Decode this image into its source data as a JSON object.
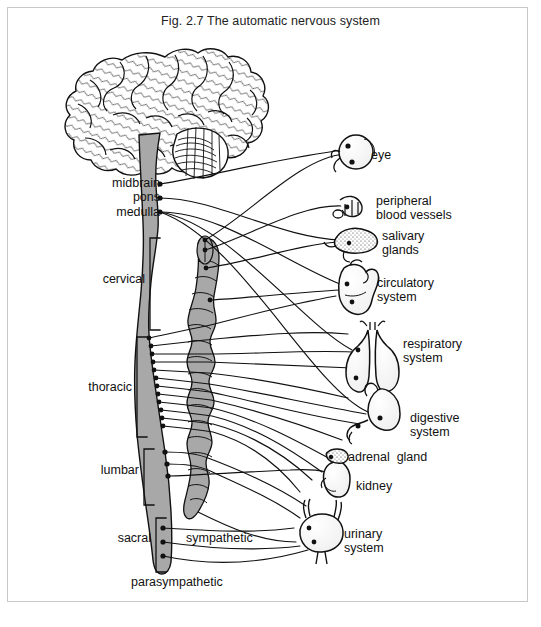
{
  "figure": {
    "title": "Fig. 2.7 The automatic nervous system",
    "ink_color": "#111111",
    "fill_gray": "#a8a8a8",
    "border_color": "#c9c9c9",
    "background": "#ffffff"
  },
  "brainstem_labels": [
    {
      "name": "midbrain",
      "text": "midbrain",
      "x": 100,
      "y": 183
    },
    {
      "name": "pons",
      "text": "pons",
      "x": 130,
      "y": 197
    },
    {
      "name": "medulla",
      "text": "medulla",
      "x": 110,
      "y": 212
    }
  ],
  "spinal_regions": [
    {
      "name": "cervical",
      "text": "cervical",
      "x": 92,
      "y": 272,
      "bracket_top": 238,
      "bracket_bottom": 330
    },
    {
      "name": "thoracic",
      "text": "thoracic",
      "x": 92,
      "y": 385,
      "bracket_top": 337,
      "bracket_bottom": 437
    },
    {
      "name": "lumbar",
      "text": "lumbar",
      "x": 100,
      "y": 466,
      "bracket_top": 449,
      "bracket_bottom": 505
    },
    {
      "name": "sacral",
      "text": "sacral",
      "x": 110,
      "y": 538,
      "bracket_top": 518,
      "bracket_bottom": 572
    }
  ],
  "chain_labels": [
    {
      "name": "sympathetic",
      "text": "sympathetic",
      "x": 186,
      "y": 538
    },
    {
      "name": "parasympathetic",
      "text": "parasympathetic",
      "x": 131,
      "y": 582
    }
  ],
  "organ_labels": [
    {
      "name": "eye",
      "lines": [
        "eye"
      ],
      "x": 371,
      "y": 155
    },
    {
      "name": "peripheral-blood-vessels",
      "lines": [
        "peripheral",
        "blood vessels"
      ],
      "x": 376,
      "y": 201
    },
    {
      "name": "salivary-glands",
      "lines": [
        "salivary",
        "glands"
      ],
      "x": 382,
      "y": 235
    },
    {
      "name": "circulatory-system",
      "lines": [
        "circulatory",
        "system"
      ],
      "x": 377,
      "y": 283
    },
    {
      "name": "respiratory-system",
      "lines": [
        "respiratory",
        "system"
      ],
      "x": 403,
      "y": 344
    },
    {
      "name": "digestive-system",
      "lines": [
        "digestive",
        "system"
      ],
      "x": 410,
      "y": 418
    },
    {
      "name": "adrenal-gland",
      "lines": [
        "adrenal  gland"
      ],
      "x": 348,
      "y": 457
    },
    {
      "name": "kidney",
      "lines": [
        "kidney"
      ],
      "x": 356,
      "y": 486
    },
    {
      "name": "urinary-system",
      "lines": [
        "urinary",
        "system"
      ],
      "x": 344,
      "y": 534
    }
  ],
  "organs": [
    {
      "name": "eye",
      "cx": 356,
      "cy": 152
    },
    {
      "name": "peripheral-blood-vessels",
      "cx": 356,
      "cy": 208
    },
    {
      "name": "salivary-glands",
      "cx": 356,
      "cy": 240
    },
    {
      "name": "heart",
      "cx": 356,
      "cy": 288
    },
    {
      "name": "lungs",
      "cx": 372,
      "cy": 360
    },
    {
      "name": "stomach",
      "cx": 378,
      "cy": 415
    },
    {
      "name": "kidney",
      "cx": 334,
      "cy": 475
    },
    {
      "name": "bladder",
      "cx": 320,
      "cy": 538
    }
  ]
}
